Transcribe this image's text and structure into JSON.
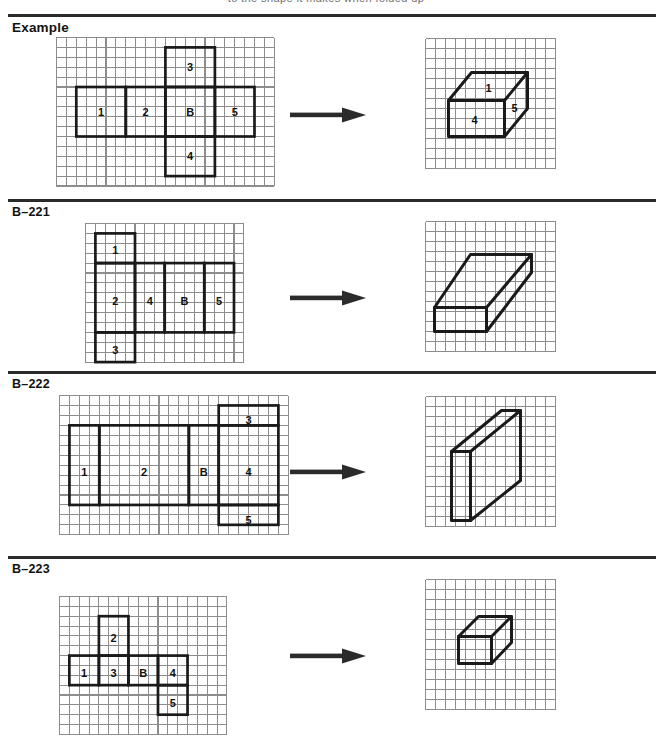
{
  "page": {
    "title_fragment": "to the shape it makes when folded up",
    "separator_color": "#2b2b2b",
    "grid_line_color": "#8d8d8d",
    "net_stroke_color": "#1a1a1a",
    "arrow_color": "#2b2b2b",
    "background": "#ffffff"
  },
  "rows": [
    {
      "label": "Example",
      "label_style": "big",
      "net": {
        "cols": 22,
        "rows": 15,
        "faces": [
          {
            "name": "1",
            "x": 2,
            "y": 5,
            "w": 5,
            "h": 5,
            "label_x": 4.5,
            "label_y": 7.6
          },
          {
            "name": "2",
            "x": 7,
            "y": 5,
            "w": 4,
            "h": 5,
            "label_x": 9.0,
            "label_y": 7.6
          },
          {
            "name": "B",
            "x": 11,
            "y": 5,
            "w": 5,
            "h": 5,
            "label_x": 13.5,
            "label_y": 7.6
          },
          {
            "name": "5",
            "x": 16,
            "y": 5,
            "w": 4,
            "h": 5,
            "label_x": 18.0,
            "label_y": 7.6
          },
          {
            "name": "3",
            "x": 11,
            "y": 1,
            "w": 5,
            "h": 4,
            "label_x": 13.5,
            "label_y": 3.1
          },
          {
            "name": "4",
            "x": 11,
            "y": 10,
            "w": 5,
            "h": 4,
            "label_x": 13.5,
            "label_y": 12.1
          }
        ]
      },
      "shape": {
        "cols": 13,
        "rows": 13,
        "type": "wide-box",
        "polyline_groups": [
          [
            [
              2.3,
              6.2
            ],
            [
              4.6,
              3.4
            ],
            [
              10.2,
              3.4
            ],
            [
              10.2,
              7.0
            ],
            [
              7.9,
              9.8
            ],
            [
              2.3,
              9.8
            ],
            [
              2.3,
              6.2
            ]
          ],
          [
            [
              2.3,
              6.2
            ],
            [
              7.9,
              6.2
            ],
            [
              7.9,
              9.8
            ]
          ],
          [
            [
              7.9,
              6.2
            ],
            [
              10.2,
              3.4
            ]
          ]
        ],
        "labels": [
          {
            "name": "1",
            "x": 6.3,
            "y": 5.1
          },
          {
            "name": "4",
            "x": 4.9,
            "y": 8.3
          },
          {
            "name": "5",
            "x": 8.9,
            "y": 7.1
          }
        ]
      }
    },
    {
      "label": "B–221",
      "label_style": "normal",
      "net": {
        "cols": 16,
        "rows": 14,
        "faces": [
          {
            "name": "1",
            "x": 1,
            "y": 1,
            "w": 4,
            "h": 3,
            "label_x": 3.0,
            "label_y": 2.8
          },
          {
            "name": "2",
            "x": 1,
            "y": 4,
            "w": 4,
            "h": 7,
            "label_x": 3.0,
            "label_y": 7.9
          },
          {
            "name": "3",
            "x": 1,
            "y": 11,
            "w": 4,
            "h": 3,
            "label_x": 3.0,
            "label_y": 12.9
          },
          {
            "name": "4",
            "x": 5,
            "y": 4,
            "w": 3,
            "h": 7,
            "label_x": 6.5,
            "label_y": 7.9
          },
          {
            "name": "B",
            "x": 8,
            "y": 4,
            "w": 4,
            "h": 7,
            "label_x": 10.0,
            "label_y": 7.9
          },
          {
            "name": "5",
            "x": 12,
            "y": 4,
            "w": 3,
            "h": 7,
            "label_x": 13.5,
            "label_y": 7.9
          }
        ]
      },
      "shape": {
        "cols": 13,
        "rows": 13,
        "type": "diagonal-long-box",
        "polyline_groups": [
          [
            [
              0.9,
              8.6
            ],
            [
              4.5,
              3.3
            ],
            [
              10.6,
              3.3
            ],
            [
              10.6,
              5.1
            ],
            [
              6.1,
              11.0
            ],
            [
              0.9,
              11.0
            ],
            [
              0.9,
              8.6
            ]
          ],
          [
            [
              0.9,
              8.6
            ],
            [
              6.1,
              8.6
            ],
            [
              6.1,
              11.0
            ]
          ],
          [
            [
              6.1,
              8.6
            ],
            [
              10.6,
              3.3
            ]
          ]
        ],
        "labels": []
      }
    },
    {
      "label": "B–222",
      "label_style": "normal",
      "net": {
        "cols": 23,
        "rows": 14,
        "faces": [
          {
            "name": "1",
            "x": 1,
            "y": 3,
            "w": 3,
            "h": 8,
            "label_x": 2.5,
            "label_y": 7.8
          },
          {
            "name": "2",
            "x": 4,
            "y": 3,
            "w": 9,
            "h": 8,
            "label_x": 8.5,
            "label_y": 7.8
          },
          {
            "name": "B",
            "x": 13,
            "y": 3,
            "w": 3,
            "h": 8,
            "label_x": 14.5,
            "label_y": 7.8
          },
          {
            "name": "4",
            "x": 16,
            "y": 3,
            "w": 6,
            "h": 8,
            "label_x": 19.0,
            "label_y": 7.8
          },
          {
            "name": "3",
            "x": 16,
            "y": 1,
            "w": 6,
            "h": 2,
            "label_x": 19.0,
            "label_y": 2.6
          },
          {
            "name": "5",
            "x": 16,
            "y": 11,
            "w": 6,
            "h": 2,
            "label_x": 19.0,
            "label_y": 12.6
          }
        ]
      },
      "shape": {
        "cols": 13,
        "rows": 13,
        "type": "upright-slab",
        "polyline_groups": [
          [
            [
              2.6,
              5.5
            ],
            [
              7.6,
              1.4
            ],
            [
              9.5,
              1.4
            ],
            [
              9.5,
              8.4
            ],
            [
              4.5,
              12.4
            ],
            [
              2.6,
              12.4
            ],
            [
              2.6,
              5.5
            ]
          ],
          [
            [
              2.6,
              5.5
            ],
            [
              4.5,
              5.5
            ],
            [
              4.5,
              12.4
            ]
          ],
          [
            [
              4.5,
              5.5
            ],
            [
              9.5,
              1.4
            ]
          ]
        ],
        "labels": []
      }
    },
    {
      "label": "B–223",
      "label_style": "normal",
      "net": {
        "cols": 17,
        "rows": 14,
        "faces": [
          {
            "name": "1",
            "x": 1,
            "y": 6,
            "w": 3,
            "h": 3,
            "label_x": 2.5,
            "label_y": 7.9
          },
          {
            "name": "3",
            "x": 4,
            "y": 6,
            "w": 3,
            "h": 3,
            "label_x": 5.5,
            "label_y": 7.9
          },
          {
            "name": "B",
            "x": 7,
            "y": 6,
            "w": 3,
            "h": 3,
            "label_x": 8.5,
            "label_y": 7.9
          },
          {
            "name": "4",
            "x": 10,
            "y": 6,
            "w": 3,
            "h": 3,
            "label_x": 11.5,
            "label_y": 7.9
          },
          {
            "name": "2",
            "x": 4,
            "y": 2,
            "w": 3,
            "h": 4,
            "label_x": 5.5,
            "label_y": 4.3
          },
          {
            "name": "5",
            "x": 10,
            "y": 9,
            "w": 3,
            "h": 3,
            "label_x": 11.5,
            "label_y": 10.9
          }
        ]
      },
      "shape": {
        "cols": 13,
        "rows": 13,
        "type": "small-cube",
        "polyline_groups": [
          [
            [
              3.3,
              5.7
            ],
            [
              5.3,
              3.7
            ],
            [
              8.6,
              3.7
            ],
            [
              8.6,
              6.3
            ],
            [
              6.6,
              8.4
            ],
            [
              3.3,
              8.4
            ],
            [
              3.3,
              5.7
            ]
          ],
          [
            [
              3.3,
              5.7
            ],
            [
              6.6,
              5.7
            ],
            [
              6.6,
              8.4
            ]
          ],
          [
            [
              6.6,
              5.7
            ],
            [
              8.6,
              3.7
            ]
          ]
        ],
        "labels": []
      }
    }
  ],
  "arrow": {
    "name": "right-arrow",
    "shaft_label": "maps-to"
  }
}
